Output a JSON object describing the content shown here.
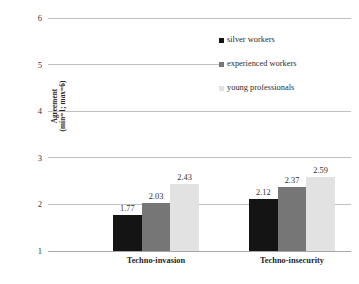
{
  "chart_data": {
    "type": "bar",
    "title": "",
    "subtitle": "",
    "xlabel": "",
    "ylabel": "Agreement (min=1; max=6)",
    "categories": [
      "Techno-invasion",
      "Techno-insecurity"
    ],
    "series": [
      {
        "name": "silver workers",
        "color": "#141414",
        "values": [
          1.77,
          2.03
        ]
      },
      {
        "name": "experienced workers",
        "color": "#767676",
        "values": [
          2.03,
          2.37
        ]
      },
      {
        "name": "young professionals",
        "color": "#e2e2e2",
        "values": [
          2.43,
          2.59
        ]
      }
    ],
    "data_labels": [
      [
        "1.77",
        "2.03",
        "2.43"
      ],
      [
        "2.12",
        "2.37",
        "2.59"
      ]
    ],
    "values_by_group": [
      [
        1.77,
        2.03,
        2.43
      ],
      [
        2.12,
        2.37,
        2.59
      ]
    ],
    "ylim": [
      1,
      6
    ],
    "yticks": [
      1,
      2,
      3,
      4,
      5,
      6
    ],
    "ytick_labels": [
      "1",
      "2",
      "3",
      "4",
      "5",
      "6"
    ],
    "grid": true,
    "grid_axis": "y",
    "legend_position": "upper-right",
    "bar_baseline": 1
  },
  "axis": {
    "y_title_line1": "Agreement",
    "y_title_line2": "(min=1; max=6)"
  },
  "legend": {
    "items": [
      {
        "label": "silver workers"
      },
      {
        "label": "experienced workers"
      },
      {
        "label": "young professionals"
      }
    ]
  }
}
